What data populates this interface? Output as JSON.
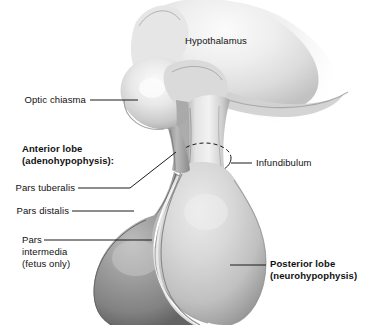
{
  "figure": {
    "background_color": "#ffffff",
    "width": 374,
    "height": 325
  },
  "palette": {
    "line_color": "#1a1a1a",
    "text_color": "#111111",
    "hypothalamus_light": "#f2f2f2",
    "hypothalamus_mid": "#d5d5d5",
    "hypothalamus_shadow": "#a9a9a9",
    "posterior_lobe_light": "#e0e0e0",
    "posterior_lobe_mid": "#c4c4c4",
    "posterior_lobe_shadow": "#8e8e8e",
    "anterior_lobe_light": "#bdbdbd",
    "anterior_lobe_mid": "#9a9a9a",
    "anterior_lobe_shadow": "#6d6d6d",
    "pars_intermedia": "#8f8f8f"
  },
  "labels": {
    "hypothalamus": "Hypothalamus",
    "optic_chiasma": "Optic chiasma",
    "anterior_lobe_line1": "Anterior lobe",
    "anterior_lobe_line2": "(adenohypophysis):",
    "pars_tuberalis": "Pars tuberalis",
    "pars_distalis": "Pars distalis",
    "pars_intermedia_line1": "Pars",
    "pars_intermedia_line2": "intermedia",
    "pars_intermedia_line3": "(fetus only)",
    "infundibulum": "Infundibulum",
    "posterior_lobe_line1": "Posterior lobe",
    "posterior_lobe_line2": "(neurohypophysis)"
  },
  "structures": [
    {
      "name": "hypothalamus",
      "label": "Hypothalamus",
      "tone": "light"
    },
    {
      "name": "optic-chiasma",
      "label": "Optic chiasma",
      "tone": "light"
    },
    {
      "name": "infundibulum",
      "label": "Infundibulum",
      "tone": "light"
    },
    {
      "name": "anterior-lobe",
      "label": "Anterior lobe (adenohypophysis)",
      "tone": "dark"
    },
    {
      "name": "pars-tuberalis",
      "label": "Pars tuberalis",
      "tone": "dark"
    },
    {
      "name": "pars-distalis",
      "label": "Pars distalis",
      "tone": "dark"
    },
    {
      "name": "pars-intermedia",
      "label": "Pars intermedia (fetus only)",
      "tone": "dark"
    },
    {
      "name": "posterior-lobe",
      "label": "Posterior lobe (neurohypophysis)",
      "tone": "mid"
    }
  ]
}
